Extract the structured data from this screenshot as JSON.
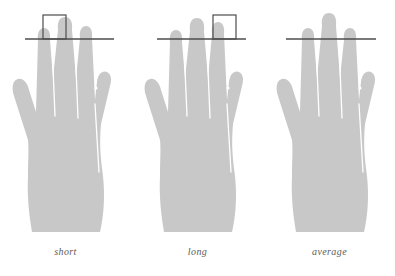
{
  "diagram": {
    "background_color": "#ffffff",
    "hand_fill_color": "#c8c8c8",
    "crease_line_color": "#ffffff",
    "reference_line_color": "#4d4d4d",
    "highlight_box_color": "#4d4d4d",
    "caption_color": "#5b5b5b"
  },
  "panels": [
    {
      "id": "short",
      "caption": "short",
      "hand": "left-hand-silhouette",
      "reference_line": "index-finger-reference-line",
      "highlight_box": "index-finger-highlight-box",
      "highlight_target": "index-finger",
      "has_highlight_box": "yes",
      "ring_vs_index": "index finger tip sits below the reference line"
    },
    {
      "id": "long",
      "caption": "long",
      "hand": "left-hand-silhouette",
      "reference_line": "index-finger-reference-line",
      "highlight_box": "ring-finger-highlight-box",
      "highlight_target": "ring-finger",
      "has_highlight_box": "yes",
      "ring_vs_index": "ring finger tip rises above the reference line"
    },
    {
      "id": "average",
      "caption": "average",
      "hand": "left-hand-silhouette",
      "reference_line": "index-finger-reference-line",
      "highlight_box": "",
      "highlight_target": "",
      "has_highlight_box": "no",
      "ring_vs_index": "index and ring finger tips meet the reference line evenly"
    }
  ]
}
